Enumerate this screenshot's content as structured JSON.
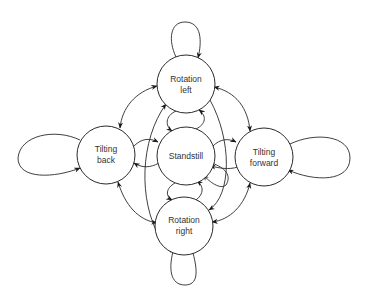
{
  "diagram": {
    "type": "state-transition",
    "nodes": [
      {
        "id": "rotation_left",
        "line1": "Rotation",
        "line2": "left",
        "cx": 186,
        "cy": 84,
        "r": 29
      },
      {
        "id": "tilting_back",
        "line1": "Tilting",
        "line2": "back",
        "cx": 106,
        "cy": 155,
        "r": 29
      },
      {
        "id": "standstill",
        "line1": "Standstill",
        "line2": "",
        "cx": 186,
        "cy": 156,
        "r": 29
      },
      {
        "id": "tilting_forward",
        "line1": "Tilting",
        "line2": "forward",
        "cx": 264,
        "cy": 157,
        "r": 29
      },
      {
        "id": "rotation_right",
        "line1": "Rotation",
        "line2": "right",
        "cx": 184,
        "cy": 226,
        "r": 29
      }
    ],
    "edges": [
      {
        "from": "rotation_left",
        "to": "rotation_left",
        "kind": "self-loop"
      },
      {
        "from": "tilting_back",
        "to": "tilting_back",
        "kind": "self-loop"
      },
      {
        "from": "tilting_forward",
        "to": "tilting_forward",
        "kind": "self-loop"
      },
      {
        "from": "rotation_right",
        "to": "rotation_right",
        "kind": "self-loop"
      },
      {
        "from": "rotation_left",
        "to": "tilting_back",
        "kind": "bidirectional"
      },
      {
        "from": "rotation_left",
        "to": "tilting_forward",
        "kind": "bidirectional"
      },
      {
        "from": "rotation_right",
        "to": "tilting_back",
        "kind": "bidirectional"
      },
      {
        "from": "rotation_right",
        "to": "tilting_forward",
        "kind": "bidirectional"
      },
      {
        "from": "standstill",
        "to": "rotation_left",
        "kind": "directed"
      },
      {
        "from": "rotation_left",
        "to": "standstill",
        "kind": "directed"
      },
      {
        "from": "standstill",
        "to": "rotation_right",
        "kind": "directed"
      },
      {
        "from": "rotation_right",
        "to": "standstill",
        "kind": "directed"
      },
      {
        "from": "tilting_back",
        "to": "standstill",
        "kind": "directed"
      },
      {
        "from": "standstill",
        "to": "tilting_back",
        "kind": "directed"
      },
      {
        "from": "standstill",
        "to": "tilting_forward",
        "kind": "directed"
      },
      {
        "from": "tilting_forward",
        "to": "standstill",
        "kind": "directed"
      },
      {
        "from": "rotation_right",
        "to": "rotation_left",
        "kind": "directed"
      },
      {
        "from": "rotation_left",
        "to": "rotation_right",
        "kind": "directed"
      }
    ]
  }
}
